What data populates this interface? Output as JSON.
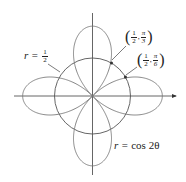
{
  "diagram": {
    "center": {
      "x": 92.5,
      "y": 96
    },
    "unit_px": 72,
    "colors": {
      "curve": "#777777",
      "axis": "#555555",
      "point": "#333333"
    },
    "axes": {
      "x_from": 14,
      "x_to": 176,
      "y_from": 13,
      "y_to": 175
    }
  },
  "curves": {
    "rose": {
      "equation_lhs": "r = ",
      "equation_rhs": "cos 2θ",
      "label": "r = cos 2θ"
    },
    "circle": {
      "lhs": "r = ",
      "num": "1",
      "den": "2",
      "label": "r = 1/2"
    }
  },
  "points": [
    {
      "r_num": "1",
      "r_den": "2",
      "theta_num": "π",
      "theta_den": "3",
      "label": "(1/2, π/3)"
    },
    {
      "r_num": "1",
      "r_den": "2",
      "theta_num": "π",
      "theta_den": "6",
      "label": "(1/2, π/6)"
    }
  ]
}
